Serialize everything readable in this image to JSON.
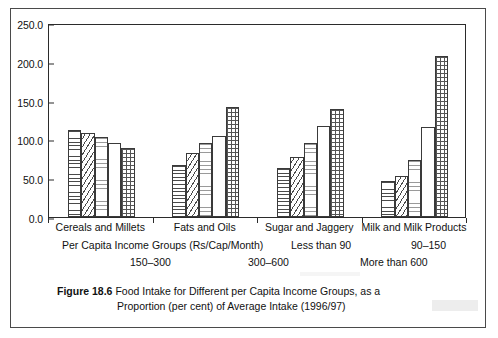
{
  "figure": {
    "number": "Figure 18.6",
    "caption_line1": "Food Intake for Different per Capita Income Groups, as a",
    "caption_line2": "Proportion (per cent) of Average Intake (1996/97)"
  },
  "axis": {
    "y_ticks": [
      "250.0",
      "200.0",
      "150.0",
      "100.0",
      "50.0",
      "0.0"
    ]
  },
  "legend_text": {
    "row1_label": "Per Capita Income Groups (Rs/Cap/Month)",
    "row1_mid": "Less than 90",
    "row1_right": "90–150",
    "row2_left": "150–300",
    "row2_mid": "300–600",
    "row2_right": "More than 600"
  },
  "chart_data": {
    "type": "bar",
    "title": "Food Intake for Different per Capita Income Groups, as a Proportion (per cent) of Average Intake (1996/97)",
    "xlabel": "Per Capita Income Groups (Rs/Cap/Month)",
    "ylabel": "",
    "ylim": [
      0,
      250
    ],
    "ytick_step": 50,
    "grid": false,
    "legend_position": "below-axis",
    "categories": [
      "Cereals and Millets",
      "Fats and Oils",
      "Sugar and Jaggery",
      "Milk and Milk Products"
    ],
    "series": [
      {
        "name": "Less than 90",
        "pattern": "horizontal-lines",
        "values": [
          112,
          67,
          63,
          46
        ]
      },
      {
        "name": "90–150",
        "pattern": "diagonal-hatch",
        "values": [
          108,
          82,
          77,
          53
        ]
      },
      {
        "name": "150–300",
        "pattern": "fine-lines",
        "values": [
          103,
          95,
          96,
          74
        ]
      },
      {
        "name": "300–600",
        "pattern": "plain",
        "values": [
          95,
          105,
          117,
          116
        ]
      },
      {
        "name": "More than 600",
        "pattern": "dotted-grid",
        "values": [
          89,
          142,
          139,
          207
        ]
      }
    ]
  }
}
